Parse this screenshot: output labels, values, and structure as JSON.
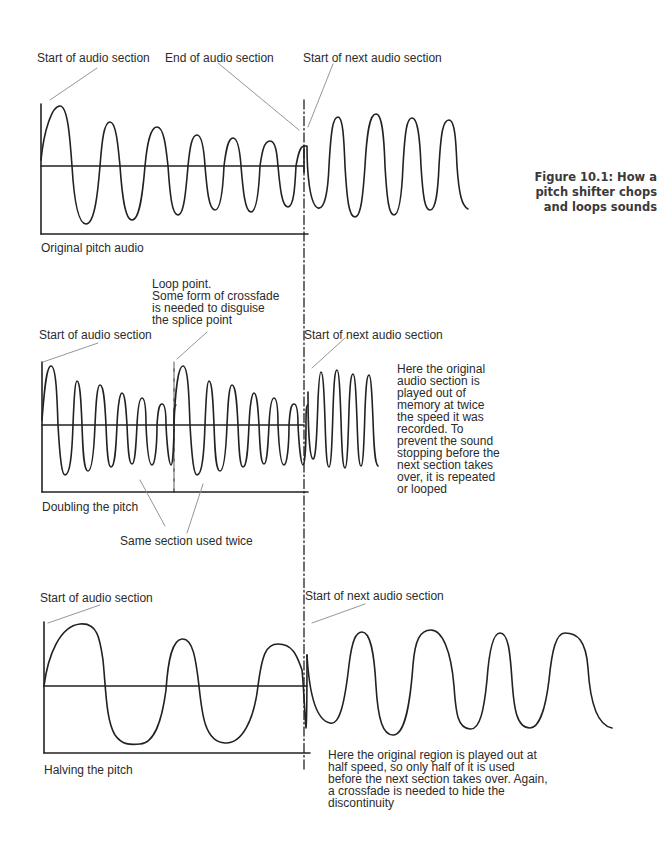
{
  "caption": "Figure 10.1: How a\npitch shifter chops\nand loops sounds",
  "panels": [
    {
      "title": "Original pitch audio",
      "labels": {
        "start": "Start of audio section",
        "end": "End of audio section",
        "next": "Start of next audio section"
      }
    },
    {
      "title": "Doubling the pitch",
      "labels": {
        "start": "Start of audio section",
        "loop": "Loop point.\nSome form of crossfade\nis needed to disguise\nthe splice point",
        "next": "Start of next audio section",
        "same": "Same section used twice"
      },
      "note": "Here the original\naudio section is\nplayed out of\nmemory at twice\nthe speed it was\nrecorded. To\nprevent the sound\nstopping before the\nnext section takes\nover, it is repeated\nor looped"
    },
    {
      "title": "Halving the pitch",
      "labels": {
        "start": "Start of audio section",
        "next": "Start of next audio section"
      },
      "note": "Here the original region is played out at\nhalf speed, so only half of it is used\nbefore the next section takes over. Again,\na crossfade is needed to hide the\ndiscontinuity"
    }
  ],
  "colors": {
    "stroke": "#222222",
    "leader": "#8a8a8a"
  }
}
